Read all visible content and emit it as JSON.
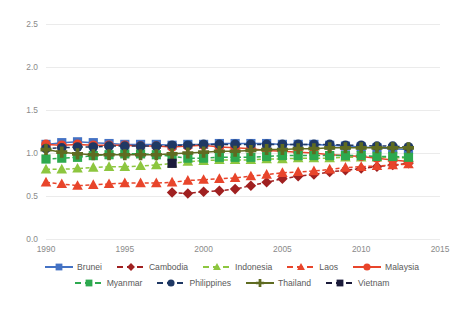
{
  "chart_data": {
    "type": "line",
    "title": "",
    "subtitle": "",
    "xlabel": "",
    "ylabel": "",
    "xlim": [
      1990,
      2015
    ],
    "ylim": [
      0.0,
      2.5
    ],
    "xticks": [
      "1990",
      "1995",
      "2000",
      "2005",
      "2010",
      "2015"
    ],
    "yticks": [
      "0.0",
      "0.5",
      "1.0",
      "1.5",
      "2.0",
      "2.5"
    ],
    "grid": "horizontal",
    "legend_position": "bottom",
    "x": [
      1990,
      1991,
      1992,
      1993,
      1994,
      1995,
      1996,
      1997,
      1998,
      1999,
      2000,
      2001,
      2002,
      2003,
      2004,
      2005,
      2006,
      2007,
      2008,
      2009,
      2010,
      2011,
      2012,
      2013
    ],
    "series": [
      {
        "name": "Brunei",
        "color": "#4472C4",
        "dash": "solid",
        "marker": "square",
        "values": [
          1.1,
          1.12,
          1.13,
          1.12,
          1.11,
          1.1,
          1.1,
          1.1,
          1.09,
          1.1,
          1.1,
          1.11,
          1.11,
          1.11,
          1.11,
          1.1,
          1.1,
          1.1,
          1.09,
          1.08,
          1.07,
          1.06,
          1.05,
          1.04
        ]
      },
      {
        "name": "Cambodia",
        "color": "#A02020",
        "dash": "dashed",
        "marker": "diamond",
        "values": [
          null,
          null,
          null,
          null,
          null,
          null,
          null,
          null,
          0.54,
          0.53,
          0.55,
          0.56,
          0.58,
          0.62,
          0.66,
          0.7,
          0.73,
          0.75,
          0.78,
          0.8,
          0.82,
          0.84,
          0.86,
          0.88
        ]
      },
      {
        "name": "Indonesia",
        "color": "#8DC63F",
        "dash": "dashed",
        "marker": "triangle",
        "values": [
          0.81,
          0.81,
          0.82,
          0.83,
          0.84,
          0.84,
          0.85,
          0.86,
          0.88,
          0.9,
          0.91,
          0.92,
          0.92,
          0.92,
          0.93,
          0.93,
          0.94,
          0.94,
          0.94,
          0.95,
          0.95,
          0.95,
          0.95,
          0.94
        ]
      },
      {
        "name": "Laos",
        "color": "#E8452B",
        "dash": "dashed",
        "marker": "triangle",
        "values": [
          0.66,
          0.64,
          0.62,
          0.63,
          0.64,
          0.65,
          0.65,
          0.65,
          0.66,
          0.68,
          0.69,
          0.7,
          0.71,
          0.73,
          0.75,
          0.77,
          0.78,
          0.79,
          0.81,
          0.83,
          0.84,
          0.85,
          0.86,
          0.87
        ]
      },
      {
        "name": "Malaysia",
        "color": "#E8452B",
        "dash": "solid",
        "marker": "circle",
        "values": [
          1.1,
          1.09,
          1.1,
          1.09,
          1.09,
          1.09,
          1.08,
          1.08,
          1.07,
          1.08,
          1.09,
          1.07,
          1.06,
          1.05,
          1.03,
          1.02,
          1.01,
          1.0,
          0.98,
          0.97,
          0.96,
          0.94,
          0.92,
          0.9
        ]
      },
      {
        "name": "Myanmar",
        "color": "#2DA94F",
        "dash": "dashed",
        "marker": "square",
        "values": [
          0.93,
          0.94,
          0.95,
          0.97,
          0.98,
          0.99,
          0.99,
          0.98,
          0.96,
          0.94,
          0.94,
          0.95,
          0.95,
          0.95,
          0.96,
          0.97,
          0.97,
          0.97,
          0.97,
          0.97,
          0.97,
          0.96,
          0.96,
          0.95
        ]
      },
      {
        "name": "Philippines",
        "color": "#1F3864",
        "dash": "dashed",
        "marker": "circle",
        "values": [
          1.05,
          1.06,
          1.07,
          1.07,
          1.08,
          1.08,
          1.08,
          1.08,
          1.09,
          1.09,
          1.1,
          1.1,
          1.1,
          1.1,
          1.1,
          1.1,
          1.1,
          1.1,
          1.1,
          1.09,
          1.09,
          1.08,
          1.08,
          1.07
        ]
      },
      {
        "name": "Thailand",
        "color": "#5F6B21",
        "dash": "solid",
        "marker": "plus",
        "values": [
          1.04,
          1.01,
          0.99,
          0.98,
          0.98,
          0.98,
          0.98,
          0.98,
          0.99,
          1.0,
          1.01,
          1.02,
          1.02,
          1.03,
          1.04,
          1.04,
          1.05,
          1.05,
          1.06,
          1.06,
          1.06,
          1.06,
          1.06,
          1.06
        ]
      },
      {
        "name": "Vietnam",
        "color": "#1B1B3A",
        "dash": "dashed",
        "marker": "square",
        "values": [
          null,
          null,
          null,
          null,
          null,
          null,
          null,
          null,
          0.88,
          null,
          null,
          null,
          null,
          null,
          null,
          null,
          null,
          null,
          null,
          null,
          null,
          null,
          null,
          null
        ]
      }
    ]
  },
  "legend": {
    "rows": [
      [
        "Brunei",
        "Cambodia",
        "Indonesia",
        "Laos",
        "Malaysia"
      ],
      [
        "Myanmar",
        "Philippines",
        "Thailand",
        "Vietnam"
      ]
    ]
  }
}
